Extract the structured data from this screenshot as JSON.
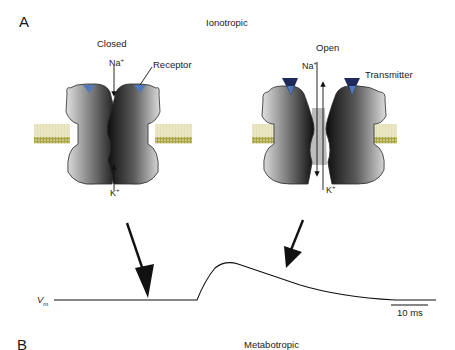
{
  "panels": {
    "a": {
      "label": "A",
      "title": "Ionotropic",
      "closed": {
        "state_label": "Closed",
        "top_ion": "Na",
        "top_ion_sup": "+",
        "bottom_ion": "K",
        "bottom_ion_sup": "+",
        "callout": "Receptor"
      },
      "open": {
        "state_label": "Open",
        "top_ion": "Na",
        "top_ion_sup": "+",
        "bottom_ion": "K",
        "bottom_ion_sup": "+",
        "callout": "Transmitter"
      },
      "trace": {
        "y_label": "V",
        "y_label_sub": "m",
        "scale_bar_label": "10 ms"
      }
    },
    "b": {
      "label": "B",
      "title": "Metabotropic"
    }
  },
  "colors": {
    "protein_dark": "#111111",
    "protein_light": "#d9d9d9",
    "receptor_site": "#4f79b8",
    "transmitter": "#1f2a5c",
    "membrane_head": "#a3a03a",
    "membrane_fill": "#f3efd2",
    "line": "#111111"
  }
}
